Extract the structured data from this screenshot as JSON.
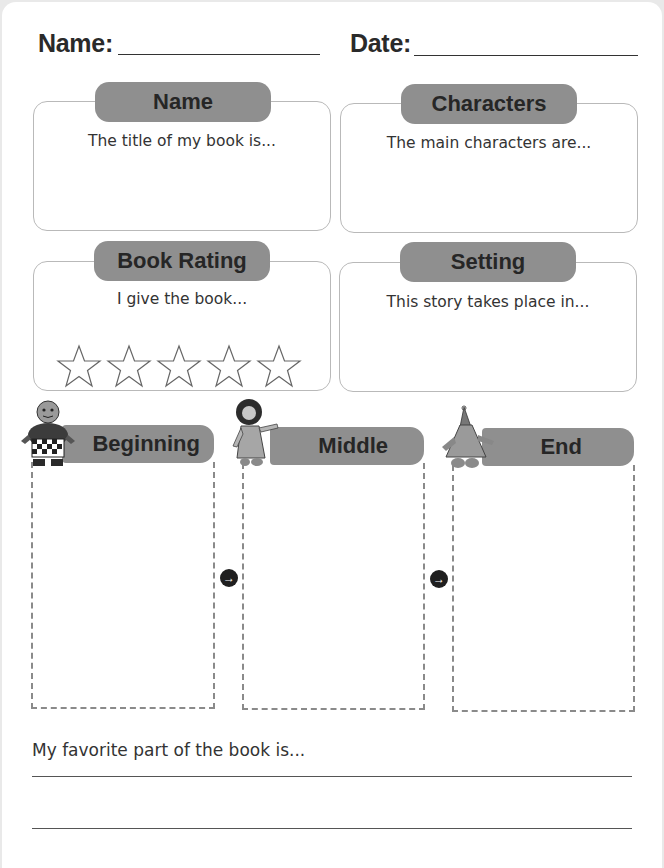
{
  "header": {
    "name_label": "Name:",
    "date_label": "Date:"
  },
  "sections": {
    "name": {
      "title": "Name",
      "prompt": "The title of my book is..."
    },
    "characters": {
      "title": "Characters",
      "prompt": "The main characters are..."
    },
    "rating": {
      "title": "Book Rating",
      "prompt": "I give the book...",
      "stars": 5,
      "stars_filled": 0
    },
    "setting": {
      "title": "Setting",
      "prompt": "This story takes place in..."
    }
  },
  "story_map": {
    "columns": [
      {
        "title": "Beginning",
        "figure": "boy-character-icon"
      },
      {
        "title": "Middle",
        "figure": "girl-character-icon"
      },
      {
        "title": "End",
        "figure": "wizard-character-icon"
      }
    ],
    "arrow_glyph": "→"
  },
  "favorite": {
    "prompt": "My favorite part of the book is...",
    "lines": 2
  },
  "colors": {
    "pill": "#8f8f8f",
    "text": "#2a2a2a",
    "card_border": "#b9b9b9",
    "dash": "#8a8a8a"
  }
}
